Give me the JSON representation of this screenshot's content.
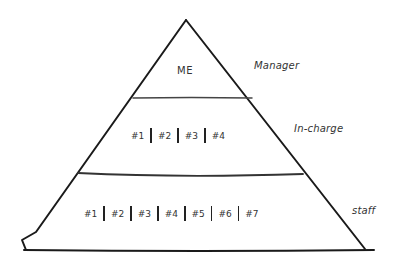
{
  "diagram": {
    "type": "pyramid",
    "style": "hand-drawn sketch",
    "stroke_color": "#1a1a1a",
    "levels": [
      {
        "id": "top",
        "content": "ME",
        "label": "Manager",
        "members": []
      },
      {
        "id": "middle",
        "content": "",
        "label": "In-charge",
        "members": [
          "#1",
          "#2",
          "#3",
          "#4"
        ]
      },
      {
        "id": "bottom",
        "content": "",
        "label": "staff",
        "members": [
          "#1",
          "#2",
          "#3",
          "#4",
          "#5",
          "#6",
          "#7"
        ]
      }
    ]
  }
}
